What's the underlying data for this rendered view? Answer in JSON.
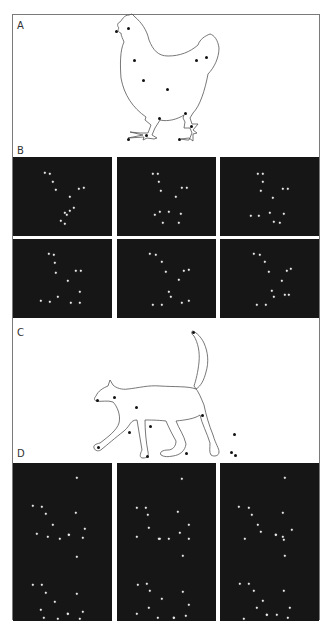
{
  "figure": {
    "panels": [
      {
        "id": "A",
        "label": "A",
        "type": "line-drawing",
        "subject": "chicken",
        "label_pos": [
          17,
          21
        ]
      },
      {
        "id": "B",
        "label": "B",
        "type": "point-light-frames",
        "subject": "chicken",
        "label_pos": [
          17,
          146
        ]
      },
      {
        "id": "C",
        "label": "C",
        "type": "line-drawing",
        "subject": "cat",
        "label_pos": [
          17,
          328
        ]
      },
      {
        "id": "D",
        "label": "D",
        "type": "point-light-frames",
        "subject": "cat",
        "label_pos": [
          17,
          449
        ]
      }
    ],
    "colors": {
      "frame_bg": "#161616",
      "dot": "#e8e8e8",
      "line": "#555555",
      "marker": "#111111",
      "border": "#7a7a7a"
    }
  },
  "chicken": {
    "markers": [
      [
        116,
        31
      ],
      [
        128,
        28
      ],
      [
        134,
        60
      ],
      [
        143,
        80
      ],
      [
        167,
        89
      ],
      [
        196,
        60
      ],
      [
        206,
        57
      ],
      [
        159,
        118
      ],
      [
        185,
        113
      ],
      [
        146,
        135
      ],
      [
        128,
        139
      ],
      [
        191,
        126
      ],
      [
        179,
        139
      ]
    ]
  },
  "cat": {
    "markers": [
      [
        193,
        332
      ],
      [
        97,
        400
      ],
      [
        114,
        397
      ],
      [
        136,
        407
      ],
      [
        150,
        426
      ],
      [
        202,
        415
      ],
      [
        129,
        432
      ],
      [
        234,
        434
      ],
      [
        98,
        447
      ],
      [
        147,
        456
      ],
      [
        231,
        452
      ],
      [
        186,
        453
      ],
      [
        235,
        455
      ]
    ]
  },
  "frames_B": [
    {
      "pos": [
        13,
        157
      ],
      "dots": [
        [
          32,
          16
        ],
        [
          37,
          17
        ],
        [
          40,
          25
        ],
        [
          43,
          33
        ],
        [
          57,
          40
        ],
        [
          66,
          32
        ],
        [
          71,
          31
        ],
        [
          52,
          56
        ],
        [
          57,
          54
        ],
        [
          61,
          51
        ],
        [
          48,
          64
        ],
        [
          54,
          58
        ],
        [
          52,
          67
        ]
      ]
    },
    {
      "pos": [
        117,
        157
      ],
      "dots": [
        [
          36,
          17
        ],
        [
          41,
          17
        ],
        [
          42,
          25
        ],
        [
          44,
          34
        ],
        [
          59,
          40
        ],
        [
          65,
          31
        ],
        [
          70,
          31
        ],
        [
          38,
          58
        ],
        [
          43,
          55
        ],
        [
          52,
          55
        ],
        [
          64,
          57
        ],
        [
          46,
          66
        ],
        [
          62,
          66
        ]
      ]
    },
    {
      "pos": [
        220,
        157
      ],
      "dots": [
        [
          38,
          17
        ],
        [
          43,
          17
        ],
        [
          43,
          25
        ],
        [
          41,
          34
        ],
        [
          53,
          41
        ],
        [
          63,
          32
        ],
        [
          68,
          32
        ],
        [
          31,
          59
        ],
        [
          39,
          59
        ],
        [
          50,
          56
        ],
        [
          64,
          57
        ],
        [
          54,
          65
        ],
        [
          60,
          66
        ]
      ]
    },
    {
      "pos": [
        13,
        239
      ],
      "dots": [
        [
          36,
          15
        ],
        [
          41,
          16
        ],
        [
          42,
          24
        ],
        [
          43,
          34
        ],
        [
          55,
          42
        ],
        [
          63,
          32
        ],
        [
          68,
          32
        ],
        [
          28,
          62
        ],
        [
          37,
          63
        ],
        [
          45,
          58
        ],
        [
          58,
          64
        ],
        [
          67,
          53
        ],
        [
          67,
          64
        ]
      ]
    },
    {
      "pos": [
        117,
        239
      ],
      "dots": [
        [
          33,
          15
        ],
        [
          39,
          16
        ],
        [
          45,
          23
        ],
        [
          49,
          33
        ],
        [
          62,
          41
        ],
        [
          67,
          32
        ],
        [
          72,
          31
        ],
        [
          36,
          66
        ],
        [
          45,
          66
        ],
        [
          54,
          58
        ],
        [
          65,
          64
        ],
        [
          72,
          62
        ],
        [
          52,
          53
        ]
      ]
    },
    {
      "pos": [
        220,
        239
      ],
      "dots": [
        [
          34,
          15
        ],
        [
          40,
          16
        ],
        [
          45,
          23
        ],
        [
          49,
          33
        ],
        [
          62,
          42
        ],
        [
          67,
          32
        ],
        [
          71,
          30
        ],
        [
          37,
          66
        ],
        [
          46,
          66
        ],
        [
          54,
          58
        ],
        [
          65,
          56
        ],
        [
          52,
          52
        ],
        [
          69,
          56
        ]
      ]
    }
  ],
  "frames_D": [
    {
      "pos": [
        13,
        463
      ],
      "dots": [
        [
          64,
          15
        ],
        [
          20,
          43
        ],
        [
          29,
          44
        ],
        [
          33,
          51
        ],
        [
          63,
          50
        ],
        [
          40,
          62
        ],
        [
          24,
          71
        ],
        [
          35,
          74
        ],
        [
          47,
          76
        ],
        [
          56,
          72
        ],
        [
          72,
          66
        ],
        [
          70,
          75
        ],
        [
          56,
          72
        ]
      ]
    },
    {
      "pos": [
        117,
        463
      ],
      "dots": [
        [
          65,
          16
        ],
        [
          20,
          45
        ],
        [
          29,
          45
        ],
        [
          31,
          52
        ],
        [
          61,
          49
        ],
        [
          32,
          65
        ],
        [
          20,
          74
        ],
        [
          42,
          76
        ],
        [
          52,
          76
        ],
        [
          63,
          70
        ],
        [
          72,
          62
        ],
        [
          72,
          76
        ],
        [
          43,
          76
        ]
      ]
    },
    {
      "pos": [
        220,
        463
      ],
      "dots": [
        [
          65,
          15
        ],
        [
          19,
          44
        ],
        [
          29,
          45
        ],
        [
          32,
          52
        ],
        [
          63,
          50
        ],
        [
          38,
          62
        ],
        [
          41,
          69
        ],
        [
          25,
          76
        ],
        [
          56,
          72
        ],
        [
          64,
          77
        ],
        [
          72,
          67
        ],
        [
          63,
          74
        ],
        [
          56,
          72
        ]
      ]
    },
    {
      "pos": [
        13,
        542
      ],
      "dots": [
        [
          64,
          15
        ],
        [
          20,
          43
        ],
        [
          29,
          43
        ],
        [
          33,
          51
        ],
        [
          64,
          52
        ],
        [
          42,
          60
        ],
        [
          28,
          68
        ],
        [
          31,
          76
        ],
        [
          45,
          77
        ],
        [
          55,
          72
        ],
        [
          70,
          70
        ],
        [
          67,
          77
        ],
        [
          55,
          72
        ]
      ]
    },
    {
      "pos": [
        117,
        542
      ],
      "dots": [
        [
          66,
          14
        ],
        [
          21,
          43
        ],
        [
          30,
          42
        ],
        [
          33,
          49
        ],
        [
          66,
          50
        ],
        [
          45,
          57
        ],
        [
          32,
          66
        ],
        [
          20,
          72
        ],
        [
          41,
          76
        ],
        [
          57,
          76
        ],
        [
          72,
          63
        ],
        [
          69,
          74
        ],
        [
          57,
          76
        ]
      ]
    },
    {
      "pos": [
        220,
        542
      ],
      "dots": [
        [
          65,
          14
        ],
        [
          20,
          42
        ],
        [
          29,
          42
        ],
        [
          34,
          49
        ],
        [
          64,
          49
        ],
        [
          43,
          59
        ],
        [
          37,
          66
        ],
        [
          24,
          77
        ],
        [
          47,
          73
        ],
        [
          57,
          73
        ],
        [
          68,
          76
        ],
        [
          70,
          66
        ],
        [
          47,
          73
        ]
      ]
    }
  ]
}
